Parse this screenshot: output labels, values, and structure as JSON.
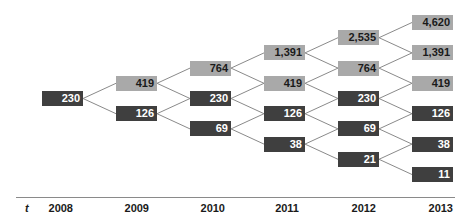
{
  "chart_data": {
    "type": "tree",
    "title": "",
    "xlabel": "t",
    "periods": [
      "2008",
      "2009",
      "2010",
      "2011",
      "2012",
      "2013"
    ],
    "levels": [
      [
        {
          "value": "230",
          "tone": "down"
        }
      ],
      [
        {
          "value": "419",
          "tone": "up"
        },
        {
          "value": "126",
          "tone": "down"
        }
      ],
      [
        {
          "value": "764",
          "tone": "up"
        },
        {
          "value": "230",
          "tone": "down"
        },
        {
          "value": "69",
          "tone": "down"
        }
      ],
      [
        {
          "value": "1,391",
          "tone": "up"
        },
        {
          "value": "419",
          "tone": "up"
        },
        {
          "value": "126",
          "tone": "down"
        },
        {
          "value": "38",
          "tone": "down"
        }
      ],
      [
        {
          "value": "2,535",
          "tone": "up"
        },
        {
          "value": "764",
          "tone": "up"
        },
        {
          "value": "230",
          "tone": "down"
        },
        {
          "value": "69",
          "tone": "down"
        },
        {
          "value": "21",
          "tone": "down"
        }
      ],
      [
        {
          "value": "4,620",
          "tone": "up"
        },
        {
          "value": "1,391",
          "tone": "up"
        },
        {
          "value": "419",
          "tone": "up"
        },
        {
          "value": "126",
          "tone": "down"
        },
        {
          "value": "38",
          "tone": "down"
        },
        {
          "value": "11",
          "tone": "down"
        }
      ]
    ],
    "colors": {
      "up": "#a9a9a9",
      "down": "#3f3f3f",
      "link": "#8a8a8a"
    }
  },
  "axis": {
    "variable": "t",
    "labels": [
      "2008",
      "2009",
      "2010",
      "2011",
      "2012",
      "2013"
    ]
  }
}
